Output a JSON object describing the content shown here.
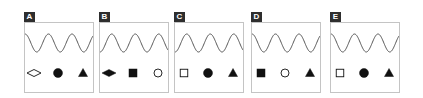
{
  "panels": [
    {
      "label": "A",
      "x": 24,
      "wave_phase": 0.0,
      "shapes": [
        {
          "shape": "diamond",
          "fill": "hollow"
        },
        {
          "shape": "circle",
          "fill": "filled"
        },
        {
          "shape": "triangle",
          "fill": "filled"
        }
      ]
    },
    {
      "label": "B",
      "x": 99,
      "wave_phase": 0.5,
      "shapes": [
        {
          "shape": "diamond",
          "fill": "filled"
        },
        {
          "shape": "square",
          "fill": "filled"
        },
        {
          "shape": "circle",
          "fill": "hollow"
        }
      ]
    },
    {
      "label": "C",
      "x": 174,
      "wave_phase": 0.5,
      "shapes": [
        {
          "shape": "square",
          "fill": "hollow"
        },
        {
          "shape": "circle",
          "fill": "filled"
        },
        {
          "shape": "triangle",
          "fill": "filled"
        }
      ]
    },
    {
      "label": "D",
      "x": 251,
      "wave_phase": 0.0,
      "shapes": [
        {
          "shape": "square",
          "fill": "filled"
        },
        {
          "shape": "circle",
          "fill": "hollow"
        },
        {
          "shape": "triangle",
          "fill": "filled"
        }
      ]
    },
    {
      "label": "E",
      "x": 330,
      "wave_phase": 0.0,
      "shapes": [
        {
          "shape": "square",
          "fill": "hollow"
        },
        {
          "shape": "circle",
          "fill": "filled"
        },
        {
          "shape": "triangle",
          "fill": "filled"
        }
      ]
    }
  ],
  "colors": {
    "ink": "#111111",
    "wave": "#555555",
    "frame": "#c4c4c4",
    "label_bg": "#2e2e2e"
  }
}
